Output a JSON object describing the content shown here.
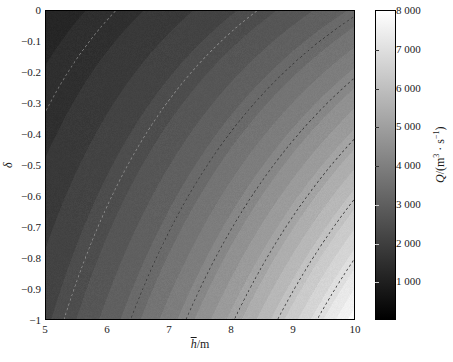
{
  "chart_data": {
    "type": "heatmap",
    "title": "",
    "xlabel": "h̄/m",
    "ylabel": "δ",
    "colorbar_label": "Q/(m³·s⁻¹)",
    "xlim": [
      5,
      10
    ],
    "ylim": [
      -1,
      0
    ],
    "zlim": [
      0,
      8000
    ],
    "xticks": [
      5,
      6,
      7,
      8,
      9,
      10
    ],
    "xticklabels": [
      "5",
      "6",
      "7",
      "8",
      "9",
      "10"
    ],
    "yticks": [
      0,
      -0.1,
      -0.2,
      -0.3,
      -0.4,
      -0.5,
      -0.6,
      -0.7,
      -0.8,
      -0.9,
      -1
    ],
    "yticklabels": [
      "0",
      "−0.1",
      "−0.2",
      "−0.3",
      "−0.4",
      "−0.5",
      "−0.6",
      "−0.7",
      "−0.8",
      "−0.9",
      "−1"
    ],
    "colorbar_ticks": [
      1000,
      2000,
      3000,
      4000,
      5000,
      6000,
      7000,
      8000
    ],
    "colorbar_ticklabels": [
      "1 000",
      "2 000",
      "3 000",
      "4 000",
      "5 000",
      "6 000",
      "7 000",
      "8 000"
    ],
    "colormap": "gray",
    "grid": false,
    "legend": false,
    "contour_levels": [
      1000,
      2000,
      3000,
      4000,
      5000,
      6000,
      7000
    ],
    "contour_linestyle": "dashed",
    "surface_model": {
      "form": "Q = A * (h^p) * (1 + c*(-delta))^q",
      "A": 2.05,
      "p": 2.18,
      "c": 1.62,
      "q": 1.05,
      "zmax": 8000
    },
    "corner_values": {
      "top_left_h5_d0": 120,
      "top_right_h10_d0": 1250,
      "bottom_left_h5_dm1": 420,
      "bottom_right_h10_dm1": 8000
    },
    "sampled_grid": {
      "h": [
        5,
        6,
        7,
        8,
        9,
        10
      ],
      "delta": [
        0,
        -0.2,
        -0.4,
        -0.6,
        -0.8,
        -1
      ],
      "values": [
        [
          120,
          200,
          300,
          430,
          590,
          780
        ],
        [
          260,
          430,
          650,
          930,
          1270,
          1680
        ],
        [
          420,
          700,
          1060,
          1510,
          2070,
          2740
        ],
        [
          600,
          1000,
          1510,
          2160,
          2960,
          3920
        ],
        [
          790,
          1320,
          2000,
          2850,
          3900,
          5170
        ],
        [
          990,
          1660,
          2510,
          3590,
          4910,
          8000
        ]
      ]
    }
  },
  "axes": {
    "x_title_base": "h",
    "x_title_unit": "/m",
    "y_title": "δ"
  },
  "colorbar": {
    "title_symbol": "Q",
    "title_rest": "/(m",
    "title_sup1": "3",
    "title_mid": " · s",
    "title_sup2": "−1",
    "title_end": ")"
  }
}
